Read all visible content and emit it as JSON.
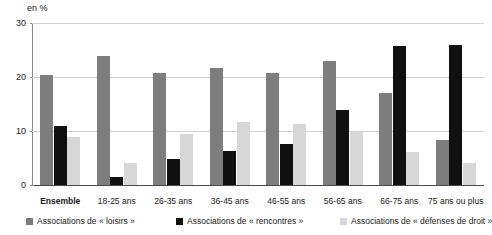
{
  "chart_data": {
    "type": "bar",
    "title": "",
    "subtitle": "",
    "unit_label": "en %",
    "xlabel": "",
    "ylabel": "",
    "ylim": [
      0,
      30
    ],
    "yticks": [
      0,
      10,
      20,
      30
    ],
    "grid": true,
    "legend_position": "bottom",
    "categories": [
      "Ensemble",
      "18-25 ans",
      "26-35 ans",
      "36-45 ans",
      "46-55 ans",
      "56-65 ans",
      "66-75 ans",
      "75 ans ou plus"
    ],
    "series": [
      {
        "name": "Associations de « loisirs »",
        "color": "#7d7d7d",
        "values": [
          20.4,
          23.9,
          20.7,
          21.7,
          20.7,
          22.9,
          17.0,
          8.4
        ]
      },
      {
        "name": "Associations de « rencontres »",
        "color": "#101010",
        "values": [
          11.0,
          1.5,
          4.8,
          6.3,
          7.6,
          13.8,
          25.8,
          26.0
        ]
      },
      {
        "name": "Associations de « défenses de droit »",
        "color": "#d7d7d7",
        "values": [
          8.8,
          4.0,
          9.5,
          11.7,
          11.3,
          9.9,
          6.2,
          4.0
        ]
      }
    ]
  },
  "legend": {
    "items": [
      "Associations de « loisirs »",
      "Associations de « rencontres »",
      "Associations de « défenses de droit »"
    ]
  }
}
